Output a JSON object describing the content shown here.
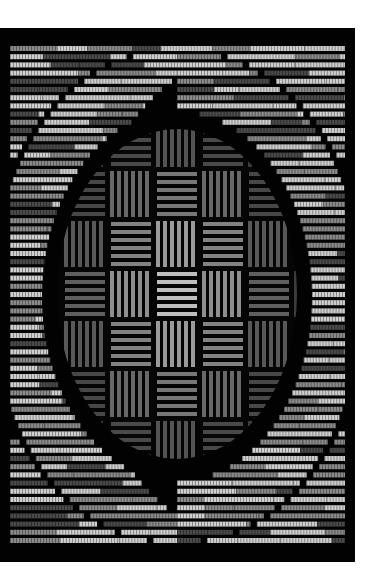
{
  "image": {
    "subject": "Woven textile with concentric oval op-art pattern",
    "description": "Black woven panel with light-grey horizontal weft bands forming concentric oval rings; central area shows alternating horizontal and vertical basket-weave blocks."
  },
  "layout": {
    "background": "#ffffff",
    "panel": {
      "x": 0,
      "y": 28,
      "width": 355,
      "height": 534,
      "color": "#020202"
    }
  },
  "pattern": {
    "center": {
      "x": 177,
      "y": 266
    },
    "outer_ring_radii": {
      "rx": 178,
      "ry": 245
    },
    "inner_oval_radii": {
      "rx": 135,
      "ry": 185
    },
    "weave_oval_radii": {
      "rx": 120,
      "ry": 165
    },
    "row_pitch": 8.2,
    "band_height": 5,
    "colors": {
      "bright": "#cfcfcf",
      "mid": "#8a8a8a",
      "dim": "#4a4a4a",
      "weave_bright": "#b8b8b8",
      "weave_dim": "#3c3c3c"
    },
    "block_size": {
      "w": 46,
      "h": 50
    }
  },
  "caption": "Woven op-art textile"
}
